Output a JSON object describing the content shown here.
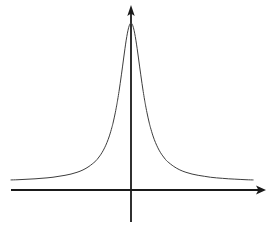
{
  "figure": {
    "title": "",
    "background_color": "#ffffff",
    "width": 275,
    "height": 228
  },
  "axes": {
    "x_axis": {
      "name": "horizontal-axis",
      "color": "#1a1a1a",
      "stroke_width": 2.1,
      "y_pixel": 190,
      "x_start_pixel": 11,
      "x_end_pixel": 266,
      "arrow": "right-arrowhead",
      "label": "",
      "ticks": []
    },
    "y_axis": {
      "name": "vertical-axis",
      "color": "#1a1a1a",
      "stroke_width": 1.8,
      "x_pixel": 131,
      "y_start_pixel": 222,
      "y_end_pixel": 5,
      "arrow": "up-arrowhead",
      "label": "",
      "ticks": []
    },
    "origin_pixel": [
      131,
      190
    ]
  },
  "curve": {
    "name": "lorentzian-curve",
    "color": "#3d3d3d",
    "stroke_width": 1.0,
    "fill": "none",
    "peak_pixel": [
      131,
      23
    ],
    "baseline_pixel_y": 182,
    "hwhm_pixels": 14,
    "x_domain_pixels": [
      11,
      258
    ]
  },
  "chart_data": {
    "type": "line",
    "title": "",
    "subtitle": "",
    "xlabel": "",
    "ylabel": "",
    "legend": [],
    "legend_position": "none",
    "grid": false,
    "annotations": [],
    "axis_style": "arrowed-cartesian-axes",
    "function": "y = A / (1 + ((x - x0)/gamma)^2)",
    "parameters": {
      "amplitude": 1.0,
      "center": 0.0,
      "gamma": 0.115,
      "baseline": 0.0
    },
    "xlim": [
      -1.0,
      1.04
    ],
    "ylim": [
      0,
      1.06
    ],
    "x": [
      -1.0,
      -0.95,
      -0.9,
      -0.85,
      -0.8,
      -0.75,
      -0.7,
      -0.65,
      -0.6,
      -0.55,
      -0.5,
      -0.45,
      -0.4,
      -0.35,
      -0.3,
      -0.28,
      -0.26,
      -0.24,
      -0.22,
      -0.2,
      -0.18,
      -0.16,
      -0.15,
      -0.14,
      -0.13,
      -0.12,
      -0.115,
      -0.11,
      -0.1,
      -0.09,
      -0.08,
      -0.07,
      -0.06,
      -0.05,
      -0.04,
      -0.03,
      -0.02,
      -0.01,
      0.0,
      0.01,
      0.02,
      0.03,
      0.04,
      0.05,
      0.06,
      0.07,
      0.08,
      0.09,
      0.1,
      0.11,
      0.115,
      0.12,
      0.13,
      0.14,
      0.15,
      0.16,
      0.18,
      0.2,
      0.22,
      0.24,
      0.26,
      0.28,
      0.3,
      0.35,
      0.4,
      0.45,
      0.5,
      0.55,
      0.6,
      0.65,
      0.7,
      0.75,
      0.8,
      0.85,
      0.9,
      0.95,
      1.0
    ],
    "y": [
      0.013,
      0.014,
      0.016,
      0.018,
      0.02,
      0.023,
      0.026,
      0.03,
      0.036,
      0.042,
      0.05,
      0.061,
      0.076,
      0.098,
      0.128,
      0.144,
      0.164,
      0.187,
      0.215,
      0.249,
      0.29,
      0.341,
      0.37,
      0.403,
      0.439,
      0.479,
      0.5,
      0.522,
      0.569,
      0.62,
      0.674,
      0.729,
      0.786,
      0.841,
      0.892,
      0.936,
      0.97,
      0.992,
      1.0,
      0.992,
      0.97,
      0.936,
      0.892,
      0.841,
      0.786,
      0.729,
      0.674,
      0.62,
      0.569,
      0.522,
      0.5,
      0.479,
      0.439,
      0.403,
      0.37,
      0.341,
      0.29,
      0.249,
      0.215,
      0.187,
      0.164,
      0.144,
      0.128,
      0.098,
      0.076,
      0.061,
      0.05,
      0.042,
      0.036,
      0.03,
      0.026,
      0.023,
      0.02,
      0.018,
      0.016,
      0.014,
      0.013
    ],
    "series": [
      {
        "name": "lorentzian",
        "color": "#3d3d3d",
        "values": [
          0.013,
          0.014,
          0.016,
          0.018,
          0.02,
          0.023,
          0.026,
          0.03,
          0.036,
          0.042,
          0.05,
          0.061,
          0.076,
          0.098,
          0.128,
          0.144,
          0.164,
          0.187,
          0.215,
          0.249,
          0.29,
          0.341,
          0.37,
          0.403,
          0.439,
          0.479,
          0.5,
          0.522,
          0.569,
          0.62,
          0.674,
          0.729,
          0.786,
          0.841,
          0.892,
          0.936,
          0.97,
          0.992,
          1.0,
          0.992,
          0.97,
          0.936,
          0.892,
          0.841,
          0.786,
          0.729,
          0.674,
          0.62,
          0.569,
          0.522,
          0.5,
          0.479,
          0.439,
          0.403,
          0.37,
          0.341,
          0.29,
          0.249,
          0.215,
          0.187,
          0.164,
          0.144,
          0.128,
          0.098,
          0.076,
          0.061,
          0.05,
          0.042,
          0.036,
          0.03,
          0.026,
          0.023,
          0.02,
          0.018,
          0.016,
          0.014,
          0.013
        ]
      }
    ]
  }
}
